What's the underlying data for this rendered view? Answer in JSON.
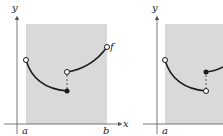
{
  "figures": [
    {
      "axis_y_label": "y",
      "axis_x_label": "x",
      "left_bound_label": "a",
      "right_bound_label": "b",
      "function_label": "f",
      "left_endpoint": "open",
      "jump_lower_point": "closed",
      "jump_upper_point": "open",
      "right_endpoint": "open"
    },
    {
      "axis_y_label": "y",
      "left_bound_label": "a",
      "left_endpoint": "open",
      "jump_lower_point": "open",
      "jump_upper_point": "closed"
    }
  ],
  "colors": {
    "shade": "#d9d9d9",
    "curve": "#1a1a1a",
    "axis": "#555555"
  }
}
